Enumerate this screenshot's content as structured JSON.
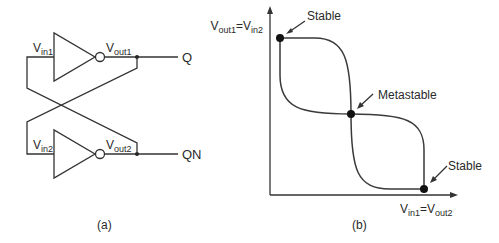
{
  "panel_a": {
    "caption": "(a)",
    "inverter1": {
      "input_label_main": "V",
      "input_label_sub": "in1",
      "output_label_main": "V",
      "output_label_sub": "out1"
    },
    "inverter2": {
      "input_label_main": "V",
      "input_label_sub": "in2",
      "output_label_main": "V",
      "output_label_sub": "out2"
    },
    "output_q": "Q",
    "output_qn": "QN"
  },
  "panel_b": {
    "caption": "(b)",
    "y_axis": {
      "main1": "V",
      "sub1": "out1",
      "eq": "=",
      "main2": "V",
      "sub2": "in2"
    },
    "x_axis": {
      "main1": "V",
      "sub1": "in1",
      "eq": "=",
      "main2": "V",
      "sub2": "out2"
    },
    "points": [
      {
        "label": "Stable"
      },
      {
        "label": "Metastable"
      },
      {
        "label": "Stable"
      }
    ]
  },
  "colors": {
    "line": "#333333",
    "text": "#2a2a2a",
    "background": "#ffffff"
  }
}
